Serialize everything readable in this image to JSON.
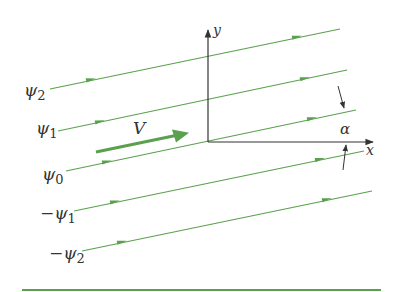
{
  "diagram": {
    "colors": {
      "streamline": "#5aa04e",
      "axis": "#333333",
      "text": "#333333",
      "background": "#ffffff"
    },
    "axes": {
      "x_label": "x",
      "y_label": "y"
    },
    "velocity_label": "V",
    "angle_label": "α",
    "streamlines": [
      {
        "label": "ψ",
        "sub": "2",
        "sign": ""
      },
      {
        "label": "ψ",
        "sub": "1",
        "sign": ""
      },
      {
        "label": "ψ",
        "sub": "0",
        "sign": ""
      },
      {
        "label": "ψ",
        "sub": "1",
        "sign": "−"
      },
      {
        "label": "ψ",
        "sub": "2",
        "sign": "−"
      }
    ]
  }
}
